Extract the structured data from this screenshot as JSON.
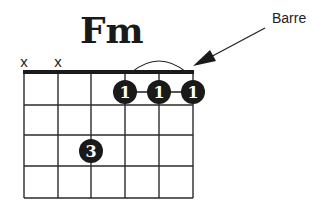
{
  "chord": {
    "name": "Fm",
    "annotation": "Barre",
    "muted_strings": [
      "x",
      "x"
    ],
    "barre_finger": "1",
    "fingers": [
      {
        "string": 4,
        "fret": 1,
        "finger": "1"
      },
      {
        "string": 5,
        "fret": 1,
        "finger": "1"
      },
      {
        "string": 6,
        "fret": 1,
        "finger": "1"
      },
      {
        "string": 3,
        "fret": 3,
        "finger": "3"
      }
    ],
    "strings": 6,
    "frets": 4
  }
}
